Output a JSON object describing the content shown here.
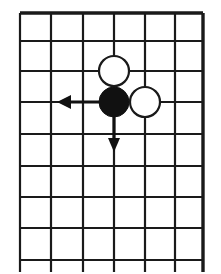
{
  "figure": {
    "kind": "go-board-diagram",
    "width": 221,
    "height": 274,
    "background_color": "#ffffff",
    "ink_color": "#1a1a1a",
    "caption": ""
  },
  "board": {
    "name": "go-board-grid",
    "columns": 7,
    "rows": 9,
    "line_color": "#1a1a1a",
    "inner_line_width": 2.2,
    "edge_line_width": 3.4,
    "vertical_line_x": [
      20,
      51,
      83,
      114,
      145,
      175,
      203
    ],
    "horizontal_line_y": [
      13,
      41,
      71,
      102,
      134,
      166,
      197,
      228,
      260
    ],
    "grid_left": 20,
    "grid_right": 203,
    "grid_top": 13,
    "grid_bottom": 260,
    "line_overhang_bottom": 12,
    "edges": {
      "top_is_thick": true,
      "right_is_thick": true,
      "left_is_thick": false,
      "bottom_is_thick": false
    }
  },
  "stones": [
    {
      "name": "white-stone-upper",
      "color": "white",
      "fill": "#ffffff",
      "stroke": "#1a1a1a",
      "cx": 114,
      "cy": 71,
      "r": 15,
      "stroke_width": 2.2,
      "column_index": 3,
      "row_index": 2
    },
    {
      "name": "black-stone",
      "color": "black",
      "fill": "#111111",
      "stroke": "#111111",
      "cx": 114,
      "cy": 102,
      "r": 15,
      "stroke_width": 1,
      "column_index": 3,
      "row_index": 3
    },
    {
      "name": "white-stone-right",
      "color": "white",
      "fill": "#ffffff",
      "stroke": "#1a1a1a",
      "cx": 145,
      "cy": 102,
      "r": 15,
      "stroke_width": 2.2,
      "column_index": 4,
      "row_index": 3
    }
  ],
  "arrows": [
    {
      "name": "arrow-left",
      "direction": "left",
      "color": "#111111",
      "shaft_width": 3.2,
      "from_x": 114,
      "from_y": 102,
      "to_x": 57,
      "to_y": 102,
      "head_length": 14,
      "head_half_width": 7
    },
    {
      "name": "arrow-down",
      "direction": "down",
      "color": "#111111",
      "shaft_width": 3.2,
      "from_x": 114,
      "from_y": 102,
      "to_x": 114,
      "to_y": 152,
      "head_length": 14,
      "head_half_width": 6
    }
  ]
}
